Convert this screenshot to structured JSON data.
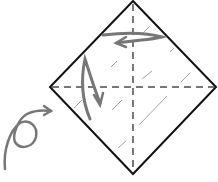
{
  "diagram": {
    "type": "origami-fold-instruction",
    "title": "",
    "paper": {
      "shape": "square-rotated-45",
      "outline_color": "#111111",
      "fill": "#ffffff",
      "vertices": {
        "top": [
          133,
          1
        ],
        "right": [
          216,
          87
        ],
        "bottom": [
          133,
          174
        ],
        "left": [
          50,
          87
        ]
      }
    },
    "creases": [
      {
        "name": "vertical-valley-crease",
        "style": "dashed",
        "color": "#777777"
      },
      {
        "name": "horizontal-valley-crease",
        "style": "dashed",
        "color": "#777777"
      }
    ],
    "arrows": [
      {
        "name": "fold-top-edge-left-arrow",
        "color": "#777777",
        "meaning": "fold right corner to the left along top"
      },
      {
        "name": "fold-down-arrow",
        "color": "#777777",
        "meaning": "fold down"
      },
      {
        "name": "turn-over-arrow",
        "color": "#777777",
        "meaning": "turn paper over"
      }
    ],
    "shading": {
      "style": "diagonal hatch marks",
      "color": "#777777"
    }
  }
}
